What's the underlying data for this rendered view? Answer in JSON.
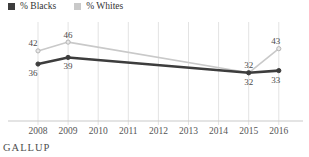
{
  "legend": {
    "items": [
      {
        "label": "% Blacks",
        "color": "#3d3d3d"
      },
      {
        "label": "% Whites",
        "color": "#c9c9c9"
      }
    ]
  },
  "footer": {
    "brand": "GALLUP"
  },
  "colors": {
    "background": "#ffffff",
    "gridline": "#e3e3e3",
    "axis_line": "#c9c9c9",
    "value_label": "#4a4a4a",
    "year_label": "#555555"
  },
  "chart_data": {
    "type": "line",
    "title": "",
    "xlabel": "",
    "ylabel": "",
    "x": [
      2008,
      2009,
      2010,
      2011,
      2012,
      2013,
      2014,
      2015,
      2016
    ],
    "series": [
      {
        "name": "% Blacks",
        "color": "#3d3d3d",
        "line_width": 2.6,
        "marker_fill": "#3d3d3d",
        "marker_stroke": "#3d3d3d",
        "label_position": "below",
        "values": [
          36,
          39,
          null,
          null,
          null,
          null,
          null,
          32,
          33
        ]
      },
      {
        "name": "% Whites",
        "color": "#c9c9c9",
        "line_width": 1.6,
        "marker_fill": "#e8e8e8",
        "marker_stroke": "#b5b5b5",
        "label_position": "above",
        "values": [
          42,
          46,
          null,
          null,
          null,
          null,
          null,
          32,
          43
        ]
      }
    ],
    "ylim": [
      10,
      55
    ],
    "grid": "vertical-only",
    "legend_position": "top-left",
    "data_labels": true
  }
}
